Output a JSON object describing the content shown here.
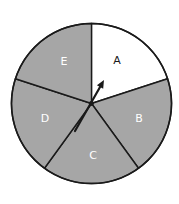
{
  "spinner": {
    "center": [
      91.5,
      103.5
    ],
    "radius": 80,
    "outline_color": "#1a1a1a",
    "sectors": [
      {
        "label": "A",
        "fill": "#ffffff",
        "text_color": "#1a1a1a",
        "label_pos": [
          117,
          60
        ]
      },
      {
        "label": "B",
        "fill": "#a6a6a6",
        "text_color": "#ffffff",
        "label_pos": [
          139,
          118
        ]
      },
      {
        "label": "C",
        "fill": "#a6a6a6",
        "text_color": "#ffffff",
        "label_pos": [
          93,
          155
        ]
      },
      {
        "label": "D",
        "fill": "#a6a6a6",
        "text_color": "#ffffff",
        "label_pos": [
          45,
          118
        ]
      },
      {
        "label": "E",
        "fill": "#a6a6a6",
        "text_color": "#ffffff",
        "label_pos": [
          64,
          61
        ]
      }
    ],
    "arrow": {
      "tail": [
        75,
        131
      ],
      "tip": [
        104,
        80
      ],
      "color": "#1a1a1a"
    }
  }
}
